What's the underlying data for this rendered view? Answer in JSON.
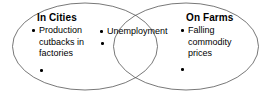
{
  "diagram": {
    "type": "venn",
    "title": "",
    "background_color": "#ffffff",
    "stroke_color": "#555555",
    "text_color": "#000000",
    "left_circle": {
      "heading": "In Cities",
      "items": [
        "Production\ncutbacks in\nfactories"
      ],
      "empty_bullets": 1
    },
    "overlap": {
      "heading": "",
      "items": [
        "Unemployment"
      ],
      "empty_bullets": 1
    },
    "right_circle": {
      "heading": "On Farms",
      "items": [
        "Falling\ncommodity\nprices"
      ],
      "empty_bullets": 1
    }
  }
}
